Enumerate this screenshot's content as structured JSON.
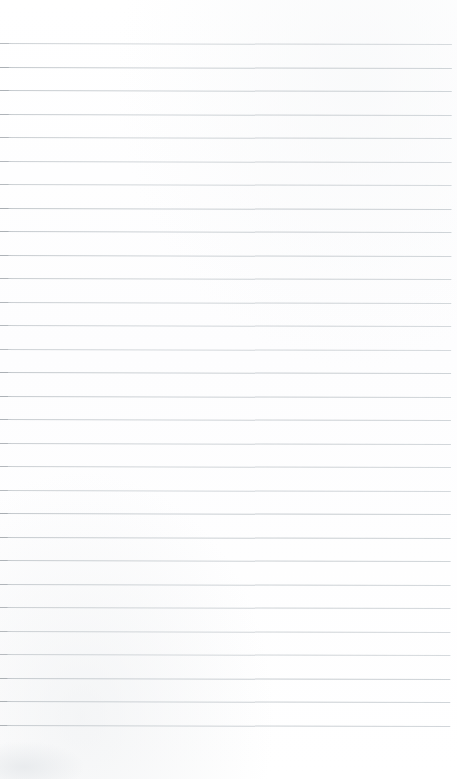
{
  "document": {
    "kind": "scanned-lined-notebook-page",
    "title": "Lined Notebook Page",
    "content_text": "",
    "page_width": 457,
    "page_height": 779,
    "background_color": "#fefefe",
    "is_blank": "true"
  },
  "ruling": {
    "line_color": "#c8ccd0",
    "line_edge_color": "#a9aeb3",
    "line_thickness_px": 1,
    "line_spacing_px": 23.5,
    "first_line_y": 43,
    "last_line_y": 725,
    "line_count": 30,
    "line_start_x": 0,
    "line_end_x": 452,
    "skew_degrees": 0.14,
    "top_margin_px": 43,
    "bottom_margin_px": 54,
    "right_margin_px": 5
  },
  "artifacts": {
    "smudge_label": "bottom-left-scan-smudge",
    "smudge_color": "#e4e7ea"
  }
}
